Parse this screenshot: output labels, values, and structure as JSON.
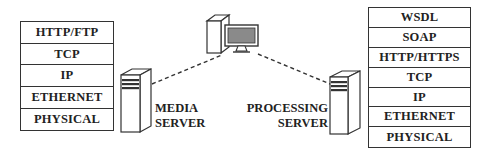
{
  "left_stack": {
    "name": "media-server-protocol-stack",
    "layers": [
      "HTTP/FTP",
      "TCP",
      "IP",
      "ETHERNET",
      "PHYSICAL"
    ]
  },
  "right_stack": {
    "name": "processing-server-protocol-stack",
    "layers": [
      "WSDL",
      "SOAP",
      "HTTP/HTTPS",
      "TCP",
      "IP",
      "ETHERNET",
      "PHYSICAL"
    ]
  },
  "media_server": {
    "line1": "MEDIA",
    "line2": "SERVER",
    "icon": "server-tower-icon"
  },
  "processing_server": {
    "line1": "PROCESSING",
    "line2": "SERVER",
    "icon": "server-tower-icon"
  },
  "client": {
    "icon": "desktop-computer-icon"
  },
  "connections": [
    {
      "from": "media_server",
      "to": "client",
      "style": "dashed"
    },
    {
      "from": "client",
      "to": "processing_server",
      "style": "dashed"
    }
  ],
  "colors": {
    "line": "#333333",
    "screen": "#8a8a8a",
    "background": "#ffffff"
  }
}
